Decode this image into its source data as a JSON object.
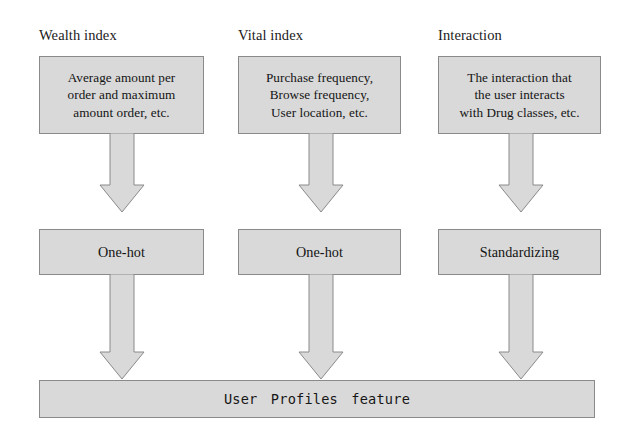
{
  "diagram": {
    "fill_color": "#d9d9d9",
    "border_color": "#8a8a8a",
    "background_color": "#ffffff",
    "text_color": "#141414",
    "columns": [
      {
        "label": "Wealth index",
        "description": "Average amount per order and maximum amount order, etc.",
        "description_lines": [
          "Average amount per",
          "order and maximum",
          "amount order, etc."
        ],
        "method": "One-hot"
      },
      {
        "label": "Vital index",
        "description": "Purchase frequency, Browse frequency, User location, etc.",
        "description_lines": [
          "Purchase frequency,",
          "Browse frequency,",
          "User location, etc."
        ],
        "method": "One-hot"
      },
      {
        "label": "Interaction",
        "description": "The interaction that the user interacts with Drug classes, etc.",
        "description_lines": [
          "The interaction that",
          "the user interacts",
          "with Drug classes, etc."
        ],
        "method": "Standardizing"
      }
    ],
    "output": {
      "label": "User  Profiles  feature"
    }
  }
}
